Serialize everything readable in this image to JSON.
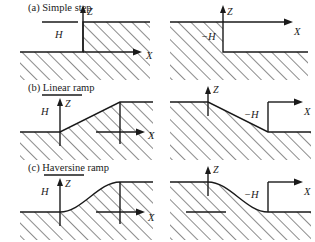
{
  "figure": {
    "type": "technical-line-diagram",
    "background_color": "#ffffff",
    "line_color": "#1a1a1a",
    "hatch_angle_deg": 45,
    "rows": [
      {
        "id": "a",
        "caption": "(a) Simple step",
        "panels": [
          {
            "id": "a-left",
            "direction": "up",
            "height_label": "H",
            "z_axis_label": "Z",
            "x_axis_label": "X"
          },
          {
            "id": "a-right",
            "direction": "down",
            "height_label": "−H",
            "z_axis_label": "Z",
            "x_axis_label": "X"
          }
        ]
      },
      {
        "id": "b",
        "caption": "(b) Linear ramp",
        "panels": [
          {
            "id": "b-left",
            "direction": "up",
            "height_label": "H",
            "z_axis_label": "Z",
            "x_axis_label": "X"
          },
          {
            "id": "b-right",
            "direction": "down",
            "height_label": "−H",
            "z_axis_label": "Z",
            "x_axis_label": "X"
          }
        ]
      },
      {
        "id": "c",
        "caption": "(c) Haversine ramp",
        "panels": [
          {
            "id": "c-left",
            "direction": "up",
            "height_label": "H",
            "z_axis_label": "Z",
            "x_axis_label": "X"
          },
          {
            "id": "c-right",
            "direction": "down",
            "height_label": "−H",
            "z_axis_label": "Z",
            "x_axis_label": "X"
          }
        ]
      }
    ]
  }
}
